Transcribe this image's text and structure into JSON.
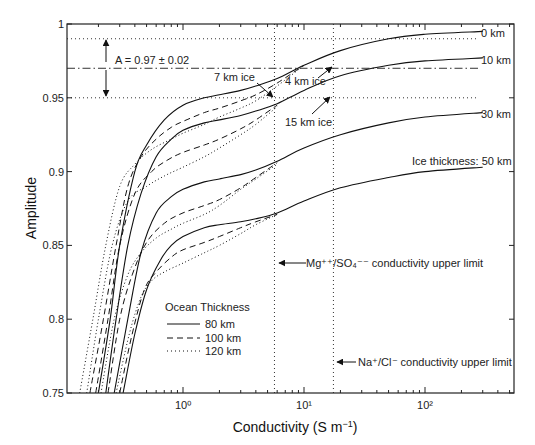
{
  "chart_data": {
    "type": "line",
    "title": "",
    "xlabel": "Conductivity (S m⁻¹)",
    "ylabel": "Amplitude",
    "xscale": "log",
    "xlim": [
      0.11,
      550
    ],
    "ylim": [
      0.75,
      1.0
    ],
    "grid": false,
    "x_ticks": [
      {
        "value": 1,
        "label": "10⁰"
      },
      {
        "value": 10,
        "label": "10¹"
      },
      {
        "value": 100,
        "label": "10²"
      }
    ],
    "y_ticks": [
      {
        "value": 0.75,
        "label": "0.75"
      },
      {
        "value": 0.8,
        "label": "0.8"
      },
      {
        "value": 0.85,
        "label": "0.85"
      },
      {
        "value": 0.9,
        "label": "0.9"
      },
      {
        "value": 0.95,
        "label": "0.95"
      },
      {
        "value": 1.0,
        "label": "1"
      }
    ],
    "legend": {
      "title": "Ocean Thickness",
      "position": "lower-left-interior",
      "entries": [
        {
          "label": "80 km",
          "style": "solid"
        },
        {
          "label": "100 km",
          "style": "dashed"
        },
        {
          "label": "120 km",
          "style": "dotted"
        }
      ]
    },
    "series": [
      {
        "name": "Ice 0 km / Ocean 80 km",
        "ice_km": 0,
        "ocean_km": 80,
        "style": "solid",
        "x": [
          0.2,
          0.25,
          0.3,
          0.4,
          0.5,
          0.7,
          1.0,
          1.5,
          2,
          3,
          4,
          6,
          10,
          20,
          50,
          100,
          300
        ],
        "y": [
          0.75,
          0.8,
          0.85,
          0.9,
          0.918,
          0.935,
          0.945,
          0.95,
          0.952,
          0.955,
          0.958,
          0.963,
          0.972,
          0.982,
          0.99,
          0.993,
          0.995
        ]
      },
      {
        "name": "Ice 0 km / Ocean 100 km",
        "ice_km": 0,
        "ocean_km": 100,
        "style": "dashed",
        "x": [
          0.17,
          0.22,
          0.28,
          0.35,
          0.45,
          0.6,
          0.8,
          1.0,
          1.5,
          2,
          3,
          4,
          6,
          10
        ],
        "y": [
          0.75,
          0.8,
          0.85,
          0.89,
          0.91,
          0.922,
          0.93,
          0.934,
          0.94,
          0.943,
          0.948,
          0.952,
          0.96,
          0.972
        ]
      },
      {
        "name": "Ice 0 km / Ocean 120 km",
        "ice_km": 0,
        "ocean_km": 120,
        "style": "dotted",
        "x": [
          0.14,
          0.18,
          0.23,
          0.3,
          0.4,
          0.55,
          0.8,
          1.0,
          1.5,
          2,
          3,
          4,
          6,
          10
        ],
        "y": [
          0.75,
          0.8,
          0.85,
          0.89,
          0.905,
          0.915,
          0.922,
          0.926,
          0.932,
          0.937,
          0.943,
          0.948,
          0.958,
          0.972
        ]
      },
      {
        "name": "Ice 10 km / Ocean 80 km",
        "ice_km": 10,
        "ocean_km": 80,
        "style": "solid",
        "x": [
          0.23,
          0.28,
          0.35,
          0.45,
          0.6,
          0.8,
          1.0,
          1.5,
          2,
          3,
          4,
          6,
          10,
          20,
          50,
          100,
          300
        ],
        "y": [
          0.75,
          0.8,
          0.85,
          0.885,
          0.91,
          0.922,
          0.928,
          0.933,
          0.935,
          0.938,
          0.941,
          0.946,
          0.955,
          0.965,
          0.972,
          0.975,
          0.977
        ]
      },
      {
        "name": "Ice 10 km / Ocean 100 km",
        "ice_km": 10,
        "ocean_km": 100,
        "style": "dashed",
        "x": [
          0.19,
          0.24,
          0.3,
          0.4,
          0.55,
          0.75,
          1.0,
          1.5,
          2,
          3,
          4,
          6
        ],
        "y": [
          0.75,
          0.8,
          0.85,
          0.885,
          0.9,
          0.908,
          0.913,
          0.918,
          0.922,
          0.929,
          0.935,
          0.945
        ]
      },
      {
        "name": "Ice 10 km / Ocean 120 km",
        "ice_km": 10,
        "ocean_km": 120,
        "style": "dotted",
        "x": [
          0.16,
          0.2,
          0.26,
          0.35,
          0.5,
          0.7,
          1.0,
          1.5,
          2,
          3,
          4,
          6
        ],
        "y": [
          0.75,
          0.8,
          0.85,
          0.88,
          0.89,
          0.897,
          0.903,
          0.91,
          0.916,
          0.925,
          0.932,
          0.944
        ]
      },
      {
        "name": "Ice 30 km / Ocean 80 km",
        "ice_km": 30,
        "ocean_km": 80,
        "style": "solid",
        "x": [
          0.27,
          0.35,
          0.45,
          0.6,
          0.8,
          1.0,
          1.5,
          2,
          3,
          4,
          6,
          10,
          20,
          50,
          100,
          300
        ],
        "y": [
          0.75,
          0.8,
          0.845,
          0.872,
          0.883,
          0.888,
          0.893,
          0.895,
          0.898,
          0.901,
          0.907,
          0.916,
          0.925,
          0.933,
          0.937,
          0.94
        ]
      },
      {
        "name": "Ice 30 km / Ocean 100 km",
        "ice_km": 30,
        "ocean_km": 100,
        "style": "dashed",
        "x": [
          0.24,
          0.3,
          0.38,
          0.5,
          0.7,
          1.0,
          1.5,
          2,
          3,
          4,
          6
        ],
        "y": [
          0.75,
          0.8,
          0.83,
          0.852,
          0.865,
          0.872,
          0.877,
          0.881,
          0.889,
          0.896,
          0.906
        ]
      },
      {
        "name": "Ice 30 km / Ocean 120 km",
        "ice_km": 30,
        "ocean_km": 120,
        "style": "dotted",
        "x": [
          0.21,
          0.27,
          0.35,
          0.45,
          0.6,
          0.8,
          1.0,
          1.5,
          2,
          3,
          4,
          6
        ],
        "y": [
          0.75,
          0.8,
          0.83,
          0.845,
          0.855,
          0.861,
          0.865,
          0.871,
          0.877,
          0.888,
          0.895,
          0.905
        ]
      },
      {
        "name": "Ice 50 km / Ocean 80 km",
        "ice_km": 50,
        "ocean_km": 80,
        "style": "solid",
        "x": [
          0.32,
          0.4,
          0.5,
          0.65,
          0.8,
          1.0,
          1.5,
          2,
          3,
          4,
          6,
          10,
          20,
          50,
          100,
          300
        ],
        "y": [
          0.75,
          0.79,
          0.82,
          0.84,
          0.85,
          0.856,
          0.862,
          0.864,
          0.866,
          0.868,
          0.872,
          0.88,
          0.889,
          0.896,
          0.9,
          0.903
        ]
      },
      {
        "name": "Ice 50 km / Ocean 100 km",
        "ice_km": 50,
        "ocean_km": 100,
        "style": "dashed",
        "x": [
          0.3,
          0.38,
          0.48,
          0.6,
          0.8,
          1.0,
          1.5,
          2,
          3,
          4,
          6
        ],
        "y": [
          0.75,
          0.79,
          0.82,
          0.832,
          0.842,
          0.847,
          0.852,
          0.856,
          0.862,
          0.866,
          0.871
        ]
      },
      {
        "name": "Ice 50 km / Ocean 120 km",
        "ice_km": 50,
        "ocean_km": 120,
        "style": "dotted",
        "x": [
          0.28,
          0.36,
          0.45,
          0.55,
          0.7,
          1.0,
          1.5,
          2,
          3,
          4,
          6
        ],
        "y": [
          0.75,
          0.79,
          0.815,
          0.826,
          0.832,
          0.838,
          0.845,
          0.85,
          0.858,
          0.864,
          0.871
        ]
      }
    ],
    "reference_lines": [
      {
        "type": "horizontal",
        "y": 0.97,
        "style": "dash-dot",
        "label": "A = 0.97 ± 0.02"
      },
      {
        "type": "horizontal",
        "y": 0.99,
        "style": "dotted"
      },
      {
        "type": "horizontal",
        "y": 0.95,
        "style": "dotted"
      },
      {
        "type": "vertical",
        "x": 5.7,
        "style": "dotted",
        "label": "Mg⁺⁺/SO₄⁻⁻ conductivity upper limit"
      },
      {
        "type": "vertical",
        "x": 17.5,
        "style": "dotted",
        "label": "Na⁺/Cl⁻ conductivity upper limit"
      }
    ],
    "annotations": [
      {
        "text": "A = 0.97 ± 0.02"
      },
      {
        "text": "7 km ice"
      },
      {
        "text": "4 km ice"
      },
      {
        "text": "15 km ice"
      },
      {
        "text": "0 km"
      },
      {
        "text": "10 km"
      },
      {
        "text": "30 km"
      },
      {
        "text": "Ice thickness: 50 km"
      },
      {
        "text": "Mg⁺⁺/SO₄⁻⁻ conductivity upper limit"
      },
      {
        "text": "Na⁺/Cl⁻ conductivity upper limit"
      }
    ]
  },
  "labels": {
    "ylabel": "Amplitude",
    "xlabel_main": "Conductivity (S m",
    "xlabel_sup": "−1",
    "xlabel_close": ")",
    "A_label": "A = 0.97 ± 0.02",
    "ice7": "7 km ice",
    "ice4": "4 km ice",
    "ice15": "15 km ice",
    "ice0": "0 km",
    "ice10": "10 km",
    "ice30": "30 km",
    "ice50": "Ice thickness: 50 km",
    "mg_label": "Mg⁺⁺/SO₄⁻⁻ conductivity upper limit",
    "na_label": "Na⁺/Cl⁻ conductivity upper limit",
    "legend_title": "Ocean Thickness",
    "legend_80": "80 km",
    "legend_100": "100 km",
    "legend_120": "120 km"
  }
}
